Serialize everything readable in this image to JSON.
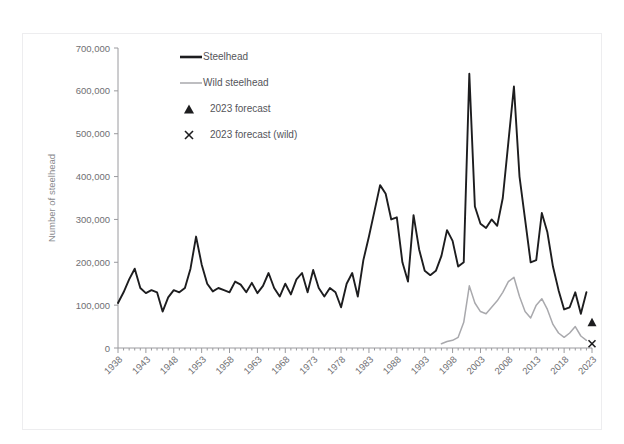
{
  "chart_data": {
    "type": "line",
    "title": "",
    "xlabel": "",
    "ylabel": "Number of steelhead",
    "ylim": [
      0,
      700000
    ],
    "xlim": [
      1938,
      2023
    ],
    "grid": false,
    "legend_position": "top-left-inside",
    "y_ticks": [
      "0",
      "100,000",
      "200,000",
      "300,000",
      "400,000",
      "500,000",
      "600,000",
      "700,000"
    ],
    "y_tick_values": [
      0,
      100000,
      200000,
      300000,
      400000,
      500000,
      600000,
      700000
    ],
    "x_ticks": [
      "1938",
      "1943",
      "1948",
      "1953",
      "1958",
      "1963",
      "1968",
      "1973",
      "1978",
      "1983",
      "1988",
      "1993",
      "1998",
      "2003",
      "2008",
      "2013",
      "2018",
      "2023"
    ],
    "x_tick_values": [
      1938,
      1943,
      1948,
      1953,
      1958,
      1963,
      1968,
      1973,
      1978,
      1983,
      1988,
      1993,
      1998,
      2003,
      2008,
      2013,
      2018,
      2023
    ],
    "series": [
      {
        "name": "Steelhead",
        "color": "#1d1d1f",
        "style": "thick-line",
        "x": [
          1938,
          1939,
          1940,
          1941,
          1942,
          1943,
          1944,
          1945,
          1946,
          1947,
          1948,
          1949,
          1950,
          1951,
          1952,
          1953,
          1954,
          1955,
          1956,
          1957,
          1958,
          1959,
          1960,
          1961,
          1962,
          1963,
          1964,
          1965,
          1966,
          1967,
          1968,
          1969,
          1970,
          1971,
          1972,
          1973,
          1974,
          1975,
          1976,
          1977,
          1978,
          1979,
          1980,
          1981,
          1982,
          1983,
          1984,
          1985,
          1986,
          1987,
          1988,
          1989,
          1990,
          1991,
          1992,
          1993,
          1994,
          1995,
          1996,
          1997,
          1998,
          1999,
          2000,
          2001,
          2002,
          2003,
          2004,
          2005,
          2006,
          2007,
          2008,
          2009,
          2010,
          2011,
          2012,
          2013,
          2014,
          2015,
          2016,
          2017,
          2018,
          2019,
          2020,
          2021,
          2022
        ],
        "values": [
          105000,
          130000,
          160000,
          185000,
          140000,
          128000,
          135000,
          130000,
          85000,
          118000,
          135000,
          130000,
          140000,
          185000,
          260000,
          195000,
          150000,
          132000,
          140000,
          135000,
          130000,
          155000,
          148000,
          130000,
          152000,
          128000,
          145000,
          175000,
          140000,
          120000,
          150000,
          125000,
          160000,
          175000,
          130000,
          182000,
          140000,
          120000,
          140000,
          130000,
          95000,
          150000,
          175000,
          120000,
          205000,
          260000,
          320000,
          380000,
          360000,
          300000,
          305000,
          200000,
          155000,
          310000,
          230000,
          180000,
          170000,
          180000,
          215000,
          275000,
          250000,
          190000,
          200000,
          640000,
          330000,
          290000,
          280000,
          300000,
          285000,
          350000,
          480000,
          610000,
          400000,
          300000,
          200000,
          205000,
          315000,
          270000,
          190000,
          135000,
          90000,
          95000,
          130000,
          80000,
          130000
        ]
      },
      {
        "name": "Wild steelhead",
        "color": "#a9a9ad",
        "style": "thin-line",
        "x": [
          1996,
          1997,
          1998,
          1999,
          2000,
          2001,
          2002,
          2003,
          2004,
          2005,
          2006,
          2007,
          2008,
          2009,
          2010,
          2011,
          2012,
          2013,
          2014,
          2015,
          2016,
          2017,
          2018,
          2019,
          2020,
          2021,
          2022
        ],
        "values": [
          10000,
          15000,
          18000,
          25000,
          60000,
          145000,
          105000,
          85000,
          80000,
          95000,
          110000,
          130000,
          155000,
          165000,
          120000,
          85000,
          70000,
          100000,
          115000,
          90000,
          55000,
          35000,
          25000,
          35000,
          50000,
          28000,
          18000
        ]
      }
    ],
    "markers": [
      {
        "name": "2023 forecast",
        "shape": "triangle",
        "color": "#1d1d1f",
        "x": 2023,
        "y": 60000
      },
      {
        "name": "2023 forecast (wild)",
        "shape": "x",
        "color": "#1d1d1f",
        "x": 2023,
        "y": 10000
      }
    ],
    "legend": [
      {
        "label": "Steelhead",
        "marker": "thick-line",
        "color": "#1d1d1f"
      },
      {
        "label": "Wild steelhead",
        "marker": "thin-line",
        "color": "#a9a9ad"
      },
      {
        "label": "2023 forecast",
        "marker": "triangle",
        "color": "#1d1d1f"
      },
      {
        "label": "2023 forecast (wild)",
        "marker": "x",
        "color": "#1d1d1f"
      }
    ]
  },
  "axis": {
    "y_title": "Number of steelhead"
  },
  "colors": {
    "main_series": "#1d1d1f",
    "wild_series": "#a9a9ad",
    "axis": "#9a9a9e",
    "tick_text": "#6f6f73",
    "background": "#ffffff"
  }
}
